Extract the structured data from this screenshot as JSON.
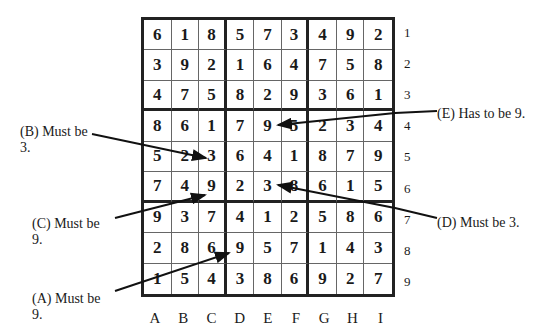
{
  "grid": [
    [
      "6",
      "1",
      "8",
      "5",
      "7",
      "3",
      "4",
      "9",
      "2"
    ],
    [
      "3",
      "9",
      "2",
      "1",
      "6",
      "4",
      "7",
      "5",
      "8"
    ],
    [
      "4",
      "7",
      "5",
      "8",
      "2",
      "9",
      "3",
      "6",
      "1"
    ],
    [
      "8",
      "6",
      "1",
      "7",
      "9",
      "5",
      "2",
      "3",
      "4"
    ],
    [
      "5",
      "2",
      "3",
      "6",
      "4",
      "1",
      "8",
      "7",
      "9"
    ],
    [
      "7",
      "4",
      "9",
      "2",
      "3",
      "8",
      "6",
      "1",
      "5"
    ],
    [
      "9",
      "3",
      "7",
      "4",
      "1",
      "2",
      "5",
      "8",
      "6"
    ],
    [
      "2",
      "8",
      "6",
      "9",
      "5",
      "7",
      "1",
      "4",
      "3"
    ],
    [
      "1",
      "5",
      "4",
      "3",
      "8",
      "6",
      "9",
      "2",
      "7"
    ]
  ],
  "row_labels": [
    "1",
    "2",
    "3",
    "4",
    "5",
    "6",
    "7",
    "8",
    "9"
  ],
  "col_labels": [
    "A",
    "B",
    "C",
    "D",
    "E",
    "F",
    "G",
    "H",
    "I"
  ],
  "annotations": {
    "B": {
      "line1": "(B) Must be",
      "line2": "3."
    },
    "C": {
      "line1": "(C) Must be",
      "line2": "9."
    },
    "A": {
      "line1": "(A) Must be",
      "line2": "9."
    },
    "E": {
      "text": "(E) Has to be 9."
    },
    "D": {
      "text": "(D) Must be 3."
    }
  }
}
